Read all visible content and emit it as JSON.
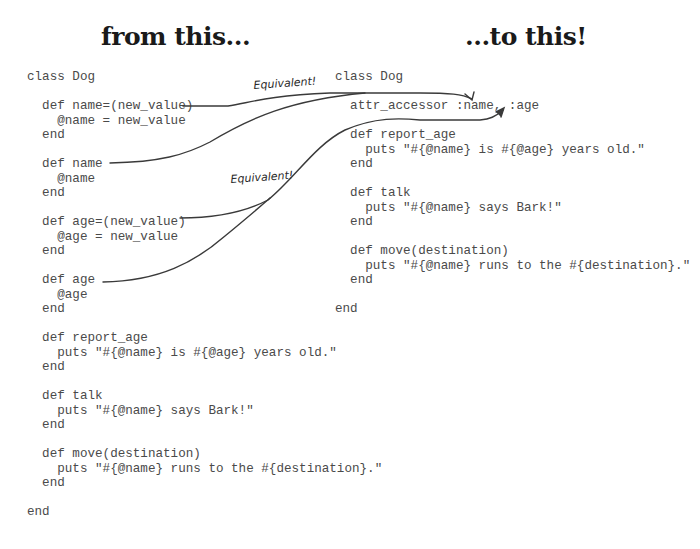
{
  "headings": {
    "left": "from this...",
    "right": "...to this!"
  },
  "annotations": [
    {
      "label": "Equivalent!"
    },
    {
      "label": "Equivalent!"
    }
  ],
  "code_before": {
    "lines": [
      "class Dog",
      "",
      "  def name=(new_value)",
      "    @name = new_value",
      "  end",
      "",
      "  def name",
      "    @name",
      "  end",
      "",
      "  def age=(new_value)",
      "    @age = new_value",
      "  end",
      "",
      "  def age",
      "    @age",
      "  end",
      "",
      "  def report_age",
      "    puts \"#{@name} is #{@age} years old.\"",
      "  end",
      "",
      "  def talk",
      "    puts \"#{@name} says Bark!\"",
      "  end",
      "",
      "  def move(destination)",
      "    puts \"#{@name} runs to the #{destination}.\"",
      "  end",
      "",
      "end"
    ]
  },
  "code_after": {
    "lines": [
      "class Dog",
      "",
      "  attr_accessor :name, :age",
      "",
      "  def report_age",
      "    puts \"#{@name} is #{@age} years old.\"",
      "  end",
      "",
      "  def talk",
      "    puts \"#{@name} says Bark!\"",
      "  end",
      "",
      "  def move(destination)",
      "    puts \"#{@name} runs to the #{destination}.\"",
      "  end",
      "",
      "end"
    ]
  },
  "colors": {
    "code_text": "#4a4a4a",
    "heading_text": "#1a1a1a",
    "arrow_stroke": "#3a3a3a",
    "background": "#ffffff"
  }
}
